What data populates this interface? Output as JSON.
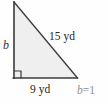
{
  "figure": {
    "type": "right-triangle",
    "caption": "Right triangle with legs b and 9 yd and hypotenuse 15 yd",
    "fill_color": "#efefef",
    "stroke_color": "#3a3a3a",
    "background_color": "#fefefe"
  },
  "geometry": {
    "apex": {
      "x": 14,
      "y": 2
    },
    "right_angle_vertex": {
      "x": 14,
      "y": 78
    },
    "base_right_vertex": {
      "x": 77,
      "y": 78
    },
    "right_angle_marker_size": 7
  },
  "labels": {
    "vertical_leg": "b",
    "hypotenuse": "15 yd",
    "base": "9 yd"
  },
  "answer": {
    "variable": "b",
    "equals": "=",
    "value": "1"
  },
  "measurements": {
    "hypotenuse_value": 15,
    "hypotenuse_unit": "yd",
    "base_value": 9,
    "base_unit": "yd",
    "unknown_leg": "b"
  }
}
